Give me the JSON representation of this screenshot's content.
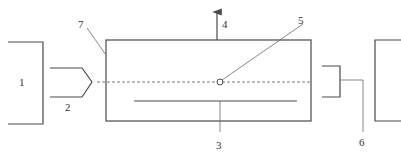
{
  "diagram": {
    "type": "schematic",
    "colors": {
      "stroke": "#4a4a4a",
      "background": "#ffffff"
    },
    "labels": {
      "item1": "1",
      "item2": "2",
      "item3": "3",
      "item4": "4",
      "item5": "5",
      "item6": "6",
      "item7": "7"
    },
    "components": [
      {
        "id": "1",
        "description": "left bracket block (source)"
      },
      {
        "id": "2",
        "description": "pointed probe / nozzle"
      },
      {
        "id": "3",
        "description": "internal horizontal element"
      },
      {
        "id": "4",
        "description": "upward arrow (flow direction)"
      },
      {
        "id": "5",
        "description": "small circle marker on centerline"
      },
      {
        "id": "6",
        "description": "right receiving bracket"
      },
      {
        "id": "7",
        "description": "main rectangular chamber"
      }
    ]
  }
}
